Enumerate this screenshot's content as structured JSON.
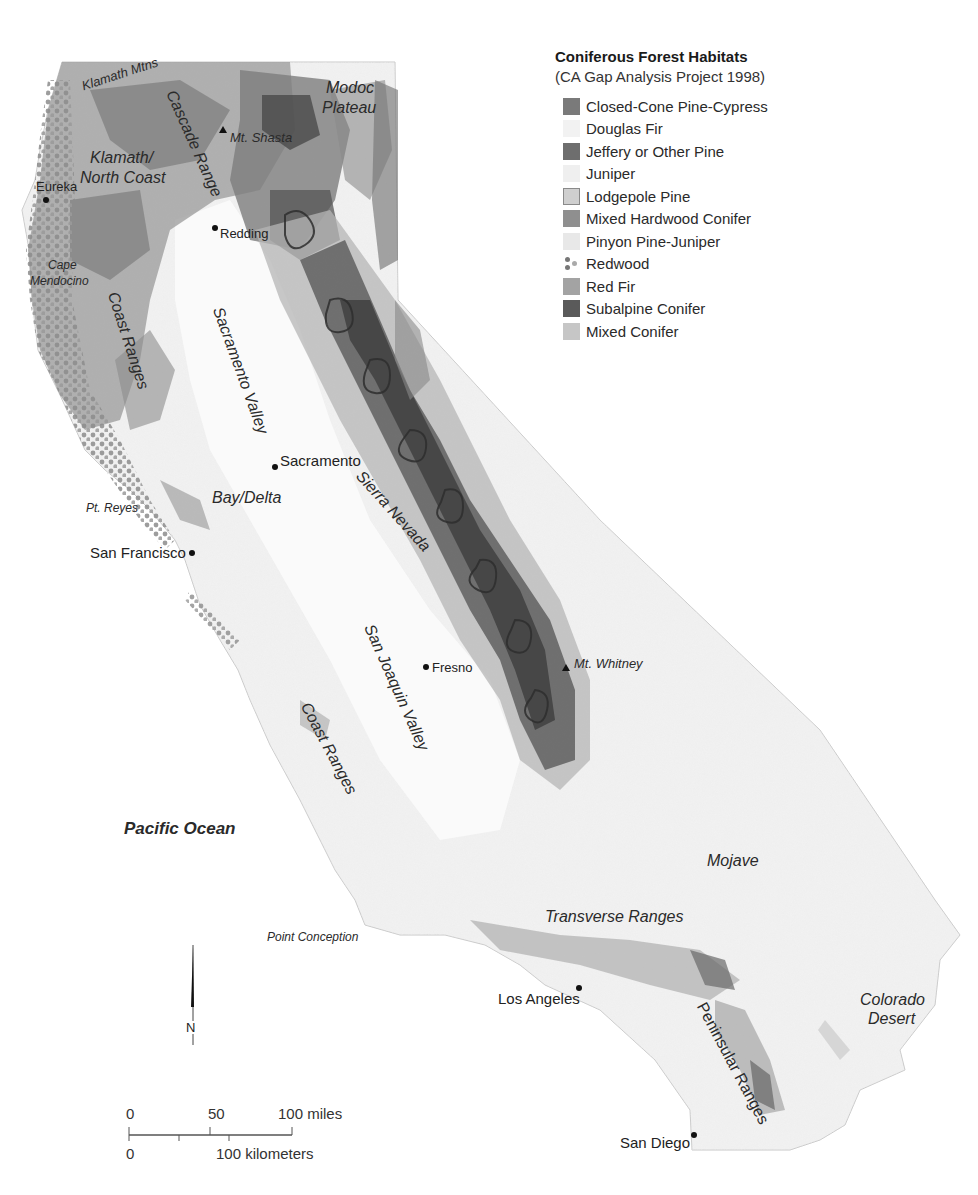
{
  "legend": {
    "title": "Coniferous Forest Habitats",
    "subtitle": "(CA Gap Analysis Project 1998)",
    "items": [
      {
        "label": "Closed-Cone Pine-Cypress",
        "color": "#7a7a7a",
        "pattern": "solid"
      },
      {
        "label": "Douglas Fir",
        "color": "#f0f0f0",
        "pattern": "stipple"
      },
      {
        "label": "Jeffery or Other Pine",
        "color": "#6e6e6e",
        "pattern": "solid"
      },
      {
        "label": "Juniper",
        "color": "#eeeeee",
        "pattern": "stipple"
      },
      {
        "label": "Lodgepole Pine",
        "color": "#cfcfcf",
        "pattern": "outlined"
      },
      {
        "label": "Mixed Hardwood Conifer",
        "color": "#8f8f8f",
        "pattern": "solid"
      },
      {
        "label": "Pinyon Pine-Juniper",
        "color": "#e6e6e6",
        "pattern": "stipple"
      },
      {
        "label": "Redwood",
        "color": "#7d7d7d",
        "pattern": "dots"
      },
      {
        "label": "Red Fir",
        "color": "#a3a3a3",
        "pattern": "solid"
      },
      {
        "label": "Subalpine Conifer",
        "color": "#5a5a5a",
        "pattern": "solid"
      },
      {
        "label": "Mixed Conifer",
        "color": "#c4c4c4",
        "pattern": "stipple"
      }
    ]
  },
  "places": {
    "cities": [
      {
        "name": "Eureka"
      },
      {
        "name": "Redding"
      },
      {
        "name": "Sacramento"
      },
      {
        "name": "San Francisco"
      },
      {
        "name": "Fresno"
      },
      {
        "name": "Los Angeles"
      },
      {
        "name": "San Diego"
      }
    ],
    "peaks": [
      {
        "name": "Mt. Shasta"
      },
      {
        "name": "Mt. Whitney"
      }
    ],
    "regions": [
      {
        "name": "Klamath Mtns"
      },
      {
        "name": "Cascade Range"
      },
      {
        "name": "Modoc"
      },
      {
        "name": "Plateau"
      },
      {
        "name": "Klamath/"
      },
      {
        "name": "North Coast"
      },
      {
        "name": "Cape"
      },
      {
        "name": "Mendocino"
      },
      {
        "name": "Coast Ranges"
      },
      {
        "name": "Sacramento Valley"
      },
      {
        "name": "Bay/Delta"
      },
      {
        "name": "Pt. Reyes"
      },
      {
        "name": "Sierra Nevada"
      },
      {
        "name": "San Joaquin Valley"
      },
      {
        "name": "Coast Ranges"
      },
      {
        "name": "Pacific Ocean"
      },
      {
        "name": "Point Conception"
      },
      {
        "name": "Transverse Ranges"
      },
      {
        "name": "Mojave"
      },
      {
        "name": "Colorado"
      },
      {
        "name": "Desert"
      },
      {
        "name": "Peninsular Ranges"
      }
    ]
  },
  "north_arrow": {
    "label": "N"
  },
  "scale_bar": {
    "miles_ticks": [
      "0",
      "50",
      "100 miles"
    ],
    "km_ticks": [
      "0",
      "100 kilometers"
    ]
  },
  "colors": {
    "land": "#efefef",
    "land_relief": "#d9d9d9",
    "forest_dark": "#4a4a4a",
    "forest_mid": "#8a8a8a",
    "forest_light": "#b8b8b8",
    "ocean": "#ffffff",
    "text": "#222222"
  }
}
